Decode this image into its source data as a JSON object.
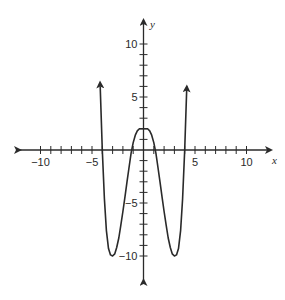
{
  "chart_data": {
    "type": "line",
    "title": "",
    "xlabel": "x",
    "ylabel": "y",
    "xlim": [
      -12,
      12
    ],
    "ylim": [
      -12,
      12
    ],
    "grid": false,
    "x_ticks": [
      -10,
      -9,
      -8,
      -7,
      -6,
      -5,
      -4,
      -3,
      -2,
      -1,
      1,
      2,
      3,
      4,
      5,
      6,
      7,
      8,
      9,
      10
    ],
    "y_ticks": [
      -10,
      -9,
      -8,
      -7,
      -6,
      -5,
      -4,
      -3,
      -2,
      -1,
      1,
      2,
      3,
      4,
      5,
      6,
      7,
      8,
      9,
      10
    ],
    "x_tick_labels": [
      {
        "value": -10,
        "label": "−10"
      },
      {
        "value": -5,
        "label": "−5"
      },
      {
        "value": 5,
        "label": "5"
      },
      {
        "value": 10,
        "label": "10"
      }
    ],
    "y_tick_labels": [
      {
        "value": 10,
        "label": "10"
      },
      {
        "value": 5,
        "label": "5"
      },
      {
        "value": -5,
        "label": "−5"
      },
      {
        "value": -10,
        "label": "−10"
      }
    ],
    "series": [
      {
        "name": "f(x)",
        "description": "Quartic-shaped curve with arrows at both ends; local max at (0, 2), local minima near (-3, -10) and (3, -10), x-intercepts near -4, -1.2, 1.2, 4",
        "x": [
          -4.2,
          -4.0,
          -3.8,
          -3.6,
          -3.4,
          -3.2,
          -3.0,
          -2.8,
          -2.6,
          -2.4,
          -2.2,
          -2.0,
          -1.8,
          -1.6,
          -1.4,
          -1.2,
          -1.0,
          -0.8,
          -0.6,
          -0.4,
          -0.2,
          0,
          0.2,
          0.4,
          0.6,
          0.8,
          1.0,
          1.2,
          1.4,
          1.6,
          1.8,
          2.0,
          2.2,
          2.4,
          2.6,
          2.8,
          3.0,
          3.2,
          3.4,
          3.6,
          3.8,
          4.0,
          4.2
        ],
        "y": [
          6.0,
          0.0,
          -4.6,
          -7.6,
          -9.3,
          -9.9,
          -10.0,
          -9.8,
          -9.2,
          -8.3,
          -7.1,
          -5.8,
          -4.4,
          -3.0,
          -1.6,
          -0.3,
          0.7,
          1.4,
          1.8,
          2.0,
          2.0,
          2.0,
          2.0,
          2.0,
          1.8,
          1.4,
          0.7,
          -0.3,
          -1.6,
          -3.0,
          -4.4,
          -5.8,
          -7.1,
          -8.3,
          -9.2,
          -9.8,
          -10.0,
          -9.9,
          -9.3,
          -7.6,
          -4.6,
          0.0,
          6.0
        ],
        "color": "#2a2a2a",
        "end_arrows": true
      }
    ]
  },
  "axes": {
    "x_label": "x",
    "y_label": "y"
  }
}
